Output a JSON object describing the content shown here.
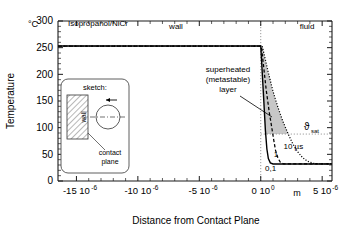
{
  "chart_data": {
    "type": "line",
    "title": "",
    "material_label": "Isopropanol/NiCr",
    "xlabel": "Distance from Contact Plane",
    "ylabel": "Temperature",
    "yunit": "°C",
    "xunit": "m",
    "xlim": [
      -16.5,
      5.8
    ],
    "ylim": [
      0,
      300
    ],
    "xticks": [
      -15,
      -10,
      -5,
      0,
      5
    ],
    "xticklabels": [
      "-15 10",
      "-10 10",
      "-5 10",
      "0 10",
      "5 10"
    ],
    "xtickexponents": [
      "-6",
      "-6",
      "-6",
      "0",
      "-6"
    ],
    "yticks": [
      0,
      50,
      100,
      150,
      200,
      250,
      300
    ],
    "yticklabels": [
      "0",
      "50",
      "100",
      "150",
      "200",
      "250",
      "300"
    ],
    "grid": false,
    "region_labels": [
      {
        "name": "wall",
        "text": "wall",
        "x": -7.0,
        "y": 288
      },
      {
        "name": "fluid",
        "text": "fluid",
        "x": 2.9,
        "y": 288
      }
    ],
    "contact_plane_x": 0,
    "t_sat_value": 88,
    "t_sat_label": "ϑ",
    "t_sat_sub": "sat",
    "wall_plateau_temp": 253,
    "bulk_temp": 32,
    "series": [
      {
        "name": "0,1 µs",
        "label": "0,1",
        "style": "solid",
        "label_x": 0.35,
        "label_y": 18,
        "points": [
          [
            -16.5,
            253
          ],
          [
            -0.15,
            253
          ],
          [
            0.0,
            253
          ],
          [
            0.25,
            150
          ],
          [
            0.38,
            95
          ],
          [
            0.5,
            60
          ],
          [
            0.62,
            42
          ],
          [
            0.78,
            34
          ],
          [
            1.0,
            32
          ],
          [
            2.0,
            32
          ],
          [
            5.8,
            32
          ]
        ]
      },
      {
        "name": "1 µs",
        "label": "1",
        "style": "dashed",
        "label_x": 1.05,
        "label_y": 45,
        "points": [
          [
            -16.5,
            253
          ],
          [
            -0.1,
            253
          ],
          [
            0.05,
            253
          ],
          [
            0.45,
            170
          ],
          [
            0.7,
            128
          ],
          [
            0.9,
            100
          ],
          [
            1.05,
            78
          ],
          [
            1.2,
            58
          ],
          [
            1.4,
            43
          ],
          [
            1.6,
            35
          ],
          [
            1.85,
            32
          ],
          [
            2.5,
            32
          ],
          [
            5.8,
            32
          ]
        ]
      },
      {
        "name": "10 µs",
        "label": "10 µs",
        "style": "dotted",
        "label_x": 1.85,
        "label_y": 60,
        "points": [
          [
            -16.5,
            253
          ],
          [
            -0.05,
            253
          ],
          [
            0.12,
            253
          ],
          [
            0.6,
            205
          ],
          [
            1.0,
            168
          ],
          [
            1.4,
            138
          ],
          [
            1.8,
            112
          ],
          [
            2.2,
            90
          ],
          [
            2.6,
            70
          ],
          [
            3.0,
            55
          ],
          [
            3.4,
            44
          ],
          [
            3.8,
            37
          ],
          [
            4.3,
            33
          ],
          [
            4.9,
            32
          ],
          [
            5.8,
            32
          ]
        ]
      }
    ],
    "shaded_region": {
      "name": "superheated-metastable-layer",
      "color": "#b4b4b4"
    },
    "annotations": [
      {
        "name": "superheated-layer-annotation",
        "lines": [
          "superheated",
          "(metastable)",
          "layer"
        ],
        "x": 195,
        "y": 72
      },
      {
        "name": "material-annotation",
        "lines": [
          "Isopropanol/NiCr"
        ],
        "x": 68,
        "y": 22
      }
    ]
  },
  "inset": {
    "name": "sketch-inset",
    "title": "sketch:",
    "wall_label": "wall",
    "contact_plane_label_line1": "contact",
    "contact_plane_label_line2": "plane"
  },
  "colors": {
    "axis": "#1a1a1a",
    "curve": "#000000",
    "shade": "#b8b8b8",
    "guide": "#8c8c8c"
  }
}
